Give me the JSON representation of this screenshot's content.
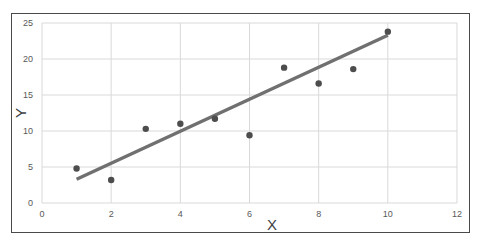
{
  "chart_data": {
    "type": "scatter",
    "title": "",
    "xlabel": "X",
    "ylabel": "Y",
    "xlim": [
      0,
      12
    ],
    "ylim": [
      0,
      25
    ],
    "x_ticks": [
      0,
      2,
      4,
      6,
      8,
      10,
      12
    ],
    "y_ticks": [
      0,
      5,
      10,
      15,
      20,
      25
    ],
    "grid": true,
    "legend": "none",
    "series": [
      {
        "name": "data",
        "type": "scatter",
        "color": "#4d4d4d",
        "x": [
          1,
          2,
          3,
          4,
          5,
          6,
          7,
          8,
          9,
          10
        ],
        "y": [
          4.8,
          3.2,
          10.3,
          11.0,
          11.7,
          9.4,
          18.8,
          16.6,
          18.6,
          23.8
        ]
      },
      {
        "name": "linear trendline",
        "type": "line",
        "color": "#707070",
        "x": [
          1,
          10
        ],
        "y": [
          3.3,
          23.3
        ]
      }
    ]
  },
  "colors": {
    "grid": "#d9d9d9",
    "points": "#4d4d4d",
    "trendline": "#707070",
    "frame": "#4a4a4a"
  }
}
